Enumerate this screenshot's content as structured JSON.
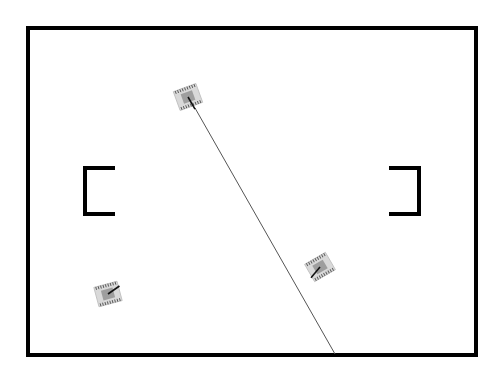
{
  "game": {
    "arena": {
      "x": 28,
      "y": 28,
      "width": 448,
      "height": 327,
      "border_color": "#000000",
      "border_width": 4,
      "background": "#ffffff"
    },
    "walls": [
      {
        "id": "left-bracket",
        "side": "left",
        "x": 85,
        "y1": 168,
        "y2": 214,
        "arm_length": 30,
        "stroke_width": 4
      },
      {
        "id": "right-bracket",
        "side": "right",
        "x": 419,
        "y1": 168,
        "y2": 214,
        "arm_length": 30,
        "stroke_width": 4
      }
    ],
    "tanks": [
      {
        "id": "tank-1",
        "cx": 188,
        "cy": 97,
        "rotation": -20,
        "barrel_angle": 60,
        "body_color": "#d9d9d9",
        "turret_color": "#9e9e9e"
      },
      {
        "id": "tank-2",
        "cx": 320,
        "cy": 267,
        "rotation": -30,
        "barrel_angle": 130,
        "body_color": "#d9d9d9",
        "turret_color": "#9e9e9e"
      },
      {
        "id": "tank-3",
        "cx": 108,
        "cy": 294,
        "rotation": -15,
        "barrel_angle": -35,
        "body_color": "#d9d9d9",
        "turret_color": "#9e9e9e"
      }
    ],
    "aim_line": {
      "from_tank": "tank-1",
      "x1": 195,
      "y1": 108,
      "x2": 335,
      "y2": 354,
      "color": "#555555",
      "width": 1
    }
  }
}
